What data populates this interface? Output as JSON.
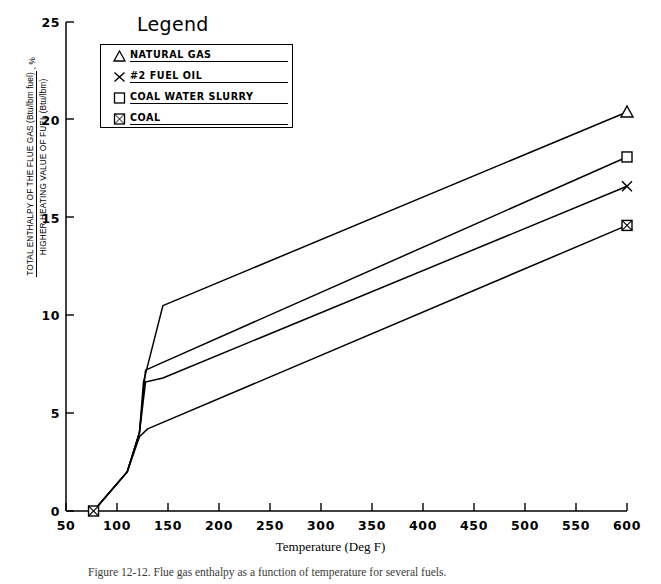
{
  "figure": {
    "caption": "Figure 12-12.  Flue gas enthalpy as a function of temperature for several fuels."
  },
  "legend": {
    "title": "Legend",
    "items": [
      {
        "label": "NATURAL GAS",
        "marker": "triangle-marker"
      },
      {
        "label": "#2 FUEL OIL",
        "marker": "x-marker"
      },
      {
        "label": "COAL WATER SLURRY",
        "marker": "square-marker"
      },
      {
        "label": "COAL",
        "marker": "crossed-square-marker"
      }
    ]
  },
  "axes": {
    "y_title_line1": "TOTAL ENTHALPY OF THE FLUE GAS (Btu/lbm fuel)",
    "y_title_line2": "HIGHER HEATING VALUE OF FUEL (Btu/lbm)",
    "y_title_unit": ", %",
    "x_title": "Temperature (Deg F)"
  },
  "chart_data": {
    "type": "line",
    "title": "",
    "xlabel": "Temperature (Deg F)",
    "ylabel": "TOTAL ENTHALPY OF THE FLUE GAS (Btu/lbm fuel) / HIGHER HEATING VALUE OF FUEL (Btu/lbm), %",
    "xlim": [
      50,
      600
    ],
    "ylim": [
      0,
      25
    ],
    "xticks": [
      50,
      100,
      150,
      200,
      250,
      300,
      350,
      400,
      450,
      500,
      550,
      600
    ],
    "yticks": [
      0,
      5,
      10,
      15,
      20,
      25
    ],
    "grid": false,
    "legend_position": "top-left",
    "series": [
      {
        "name": "NATURAL GAS",
        "marker": "triangle-marker",
        "x": [
          77,
          110,
          122,
          126,
          145,
          600
        ],
        "y": [
          0.0,
          2.0,
          4.0,
          6.6,
          10.5,
          20.4
        ]
      },
      {
        "name": "COAL WATER SLURRY",
        "marker": "square-marker",
        "x": [
          77,
          110,
          122,
          128,
          145,
          600
        ],
        "y": [
          0.0,
          2.0,
          4.0,
          7.2,
          7.6,
          18.1
        ]
      },
      {
        "name": "#2 FUEL OIL",
        "marker": "x-marker",
        "x": [
          77,
          110,
          122,
          128,
          145,
          600
        ],
        "y": [
          0.0,
          2.0,
          4.0,
          6.6,
          6.8,
          16.6
        ]
      },
      {
        "name": "COAL",
        "marker": "crossed-square-marker",
        "x": [
          77,
          110,
          122,
          130,
          600
        ],
        "y": [
          0.0,
          2.0,
          3.8,
          4.2,
          14.6
        ]
      }
    ],
    "origin_marker": {
      "x": 77,
      "y": 0,
      "marker": "crossed-square-marker"
    }
  }
}
